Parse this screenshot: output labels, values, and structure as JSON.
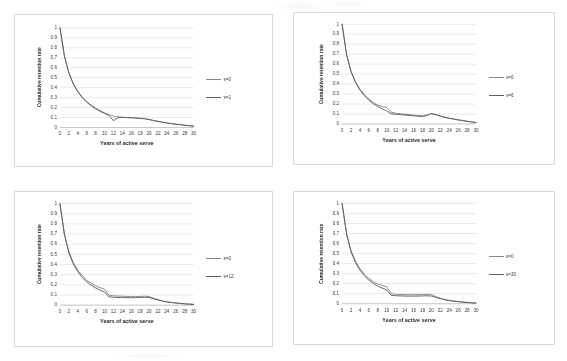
{
  "figure": {
    "panel_count": 4,
    "background": "#ffffff",
    "series_colors": {
      "baseline": "#8a8a8a",
      "comparison": "#5f5f5f"
    }
  },
  "axis": {
    "xlabel": "Years of active serve",
    "ylabel": "Cumulative retention rate",
    "xticks": [
      "0",
      "2",
      "4",
      "6",
      "8",
      "10",
      "12",
      "14",
      "16",
      "18",
      "20",
      "22",
      "24",
      "26",
      "28",
      "30"
    ],
    "yticks": [
      "1",
      "0.9",
      "0.8",
      "0.7",
      "0.6",
      "0.5",
      "0.4",
      "0.3",
      "0.2",
      "0.1",
      "0"
    ]
  },
  "chart_data": [
    {
      "type": "line",
      "title": "",
      "xlabel": "Years of active serve",
      "ylabel": "Cumulative retention rate",
      "xlim": [
        0,
        30
      ],
      "ylim": [
        0,
        1
      ],
      "grid": "horizontal",
      "legend_position": "right",
      "x": [
        0,
        1,
        2,
        3,
        4,
        5,
        6,
        7,
        8,
        9,
        10,
        11,
        12,
        13,
        14,
        15,
        16,
        17,
        18,
        19,
        20,
        21,
        22,
        23,
        24,
        25,
        26,
        27,
        28,
        29,
        30
      ],
      "series": [
        {
          "name": "s=0",
          "values": [
            1.0,
            0.72,
            0.55,
            0.44,
            0.365,
            0.305,
            0.26,
            0.225,
            0.195,
            0.17,
            0.148,
            0.13,
            0.115,
            0.108,
            0.103,
            0.1,
            0.098,
            0.095,
            0.092,
            0.088,
            0.08,
            0.07,
            0.061,
            0.053,
            0.045,
            0.039,
            0.033,
            0.028,
            0.023,
            0.018,
            0.013
          ]
        },
        {
          "name": "s=1",
          "values": [
            1.0,
            0.715,
            0.545,
            0.435,
            0.358,
            0.298,
            0.253,
            0.218,
            0.188,
            0.163,
            0.141,
            0.122,
            0.068,
            0.098,
            0.101,
            0.1,
            0.098,
            0.095,
            0.092,
            0.088,
            0.08,
            0.07,
            0.061,
            0.053,
            0.045,
            0.039,
            0.033,
            0.028,
            0.023,
            0.018,
            0.013
          ]
        }
      ]
    },
    {
      "type": "line",
      "title": "",
      "xlabel": "Years of active serve",
      "ylabel": "Cumulative retention rate",
      "xlim": [
        0,
        30
      ],
      "ylim": [
        0,
        1
      ],
      "grid": "horizontal",
      "legend_position": "right",
      "x": [
        0,
        1,
        2,
        3,
        4,
        5,
        6,
        7,
        8,
        9,
        10,
        11,
        12,
        13,
        14,
        15,
        16,
        17,
        18,
        19,
        20,
        21,
        22,
        23,
        24,
        25,
        26,
        27,
        28,
        29,
        30
      ],
      "series": [
        {
          "name": "s=0",
          "values": [
            1.0,
            0.7,
            0.53,
            0.425,
            0.35,
            0.295,
            0.25,
            0.215,
            0.19,
            0.175,
            0.165,
            0.118,
            0.108,
            0.102,
            0.098,
            0.094,
            0.09,
            0.085,
            0.082,
            0.09,
            0.105,
            0.095,
            0.08,
            0.068,
            0.058,
            0.05,
            0.042,
            0.035,
            0.028,
            0.021,
            0.015
          ]
        },
        {
          "name": "s=6",
          "values": [
            1.0,
            0.695,
            0.525,
            0.415,
            0.34,
            0.283,
            0.238,
            0.203,
            0.175,
            0.152,
            0.132,
            0.102,
            0.098,
            0.094,
            0.09,
            0.086,
            0.082,
            0.078,
            0.075,
            0.085,
            0.103,
            0.094,
            0.079,
            0.067,
            0.057,
            0.049,
            0.041,
            0.034,
            0.027,
            0.02,
            0.014
          ]
        }
      ]
    },
    {
      "type": "line",
      "title": "",
      "xlabel": "Years of active serve",
      "ylabel": "Cumulative retention rate",
      "xlim": [
        0,
        30
      ],
      "ylim": [
        0,
        1
      ],
      "grid": "horizontal",
      "legend_position": "right",
      "x": [
        0,
        1,
        2,
        3,
        4,
        5,
        6,
        7,
        8,
        9,
        10,
        11,
        12,
        13,
        14,
        15,
        16,
        17,
        18,
        19,
        20,
        21,
        22,
        23,
        24,
        25,
        26,
        27,
        28,
        29,
        30
      ],
      "series": [
        {
          "name": "s=0",
          "values": [
            1.0,
            0.7,
            0.525,
            0.42,
            0.345,
            0.29,
            0.247,
            0.215,
            0.19,
            0.172,
            0.158,
            0.098,
            0.093,
            0.09,
            0.088,
            0.086,
            0.085,
            0.085,
            0.086,
            0.088,
            0.085,
            0.07,
            0.055,
            0.043,
            0.034,
            0.028,
            0.022,
            0.018,
            0.014,
            0.011,
            0.008
          ]
        },
        {
          "name": "s=12",
          "values": [
            1.0,
            0.693,
            0.515,
            0.405,
            0.33,
            0.273,
            0.23,
            0.197,
            0.17,
            0.148,
            0.13,
            0.082,
            0.078,
            0.076,
            0.075,
            0.074,
            0.073,
            0.074,
            0.076,
            0.078,
            0.076,
            0.064,
            0.051,
            0.04,
            0.032,
            0.026,
            0.021,
            0.017,
            0.013,
            0.01,
            0.007
          ]
        }
      ]
    },
    {
      "type": "line",
      "title": "",
      "xlabel": "Years of active serve",
      "ylabel": "Cumulative retention rate",
      "xlim": [
        0,
        30
      ],
      "ylim": [
        0,
        1
      ],
      "grid": "horizontal",
      "legend_position": "right",
      "x": [
        0,
        1,
        2,
        3,
        4,
        5,
        6,
        7,
        8,
        9,
        10,
        11,
        12,
        13,
        14,
        15,
        16,
        17,
        18,
        19,
        20,
        21,
        22,
        23,
        24,
        25,
        26,
        27,
        28,
        29,
        30
      ],
      "series": [
        {
          "name": "s=0",
          "values": [
            1.0,
            0.7,
            0.53,
            0.425,
            0.35,
            0.295,
            0.252,
            0.22,
            0.198,
            0.182,
            0.17,
            0.098,
            0.094,
            0.092,
            0.091,
            0.09,
            0.09,
            0.091,
            0.092,
            0.093,
            0.09,
            0.072,
            0.055,
            0.043,
            0.034,
            0.027,
            0.022,
            0.017,
            0.013,
            0.01,
            0.007
          ]
        },
        {
          "name": "s=30",
          "values": [
            1.0,
            0.695,
            0.518,
            0.41,
            0.335,
            0.278,
            0.235,
            0.202,
            0.176,
            0.155,
            0.138,
            0.084,
            0.08,
            0.078,
            0.077,
            0.076,
            0.076,
            0.077,
            0.078,
            0.079,
            0.077,
            0.063,
            0.05,
            0.039,
            0.031,
            0.025,
            0.02,
            0.016,
            0.012,
            0.009,
            0.006
          ]
        }
      ]
    }
  ],
  "legends": [
    {
      "items": [
        {
          "label": "s=0"
        },
        {
          "label": "s=1"
        }
      ]
    },
    {
      "items": [
        {
          "label": "s=0"
        },
        {
          "label": "s=6"
        }
      ]
    },
    {
      "items": [
        {
          "label": "s=0"
        },
        {
          "label": "s=12"
        }
      ]
    },
    {
      "items": [
        {
          "label": "s=0"
        },
        {
          "label": "s=30"
        }
      ]
    }
  ]
}
